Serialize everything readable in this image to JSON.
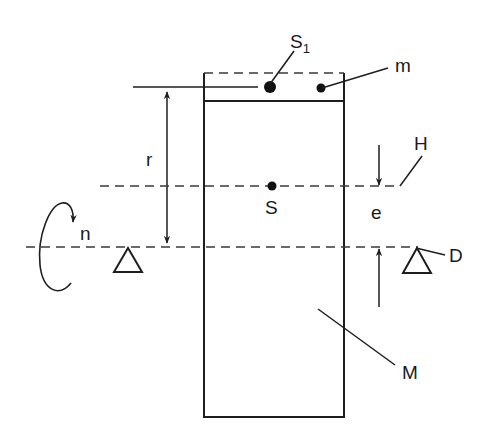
{
  "diagram": {
    "type": "rotor-unbalance-schematic",
    "labels": {
      "s1_main": "S",
      "s1_sub": "1",
      "m": "m",
      "r": "r",
      "h": "H",
      "s": "S",
      "e": "e",
      "n": "n",
      "d": "D",
      "M": "M"
    },
    "elements": [
      {
        "id": "rotor-body",
        "label": "M",
        "desc": "rectangular rotor mass"
      },
      {
        "id": "added-mass-strip",
        "desc": "dashed strip on top of rotor"
      },
      {
        "id": "point-S1",
        "label": "S1",
        "desc": "center of added mass"
      },
      {
        "id": "point-m",
        "label": "m",
        "desc": "unbalance mass"
      },
      {
        "id": "point-S",
        "label": "S",
        "desc": "center of gravity"
      },
      {
        "id": "line-H",
        "label": "H",
        "desc": "principal axis of inertia (dashed)"
      },
      {
        "id": "line-D",
        "label": "D",
        "desc": "rotation axis (dashed)"
      },
      {
        "id": "dimension-r",
        "label": "r",
        "desc": "radius from axis D to S1"
      },
      {
        "id": "dimension-e",
        "label": "e",
        "desc": "eccentricity between H and D"
      },
      {
        "id": "rotation-n",
        "label": "n",
        "desc": "rotation direction"
      },
      {
        "id": "bearing-left",
        "desc": "triangle support"
      },
      {
        "id": "bearing-right",
        "desc": "triangle support"
      }
    ],
    "colors": {
      "line": "#1e1e1e",
      "dash": "#3a3a3a",
      "background": "#ffffff"
    }
  }
}
